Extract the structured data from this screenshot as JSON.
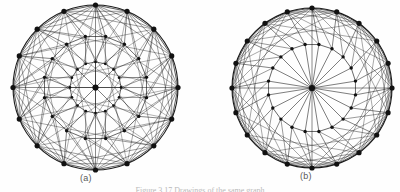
{
  "figure": {
    "background_color": "#fefefe",
    "line_color": "#1a1a1a",
    "vertex_color": "#111111",
    "caption_color": "#b9b9b9",
    "label_color": "#585858",
    "caption_text": "Figure 3.17   Drawings of the same graph",
    "panels": [
      {
        "id": "a",
        "label": "(a)",
        "center_x": 95.5,
        "center_y": 87.5,
        "radius": 82.5,
        "outer_vertices": 16,
        "rings": [
          {
            "name": "outer-ring",
            "radius_ratio": 1.0,
            "count": 16,
            "offset_deg": -90
          },
          {
            "name": "middle-ring",
            "radius_ratio": 0.63,
            "count": 16,
            "offset_deg": -78.75
          },
          {
            "name": "inner-ring",
            "radius_ratio": 0.31,
            "count": 16,
            "offset_deg": -90
          }
        ],
        "chord_steps": [
          2,
          3,
          5,
          7
        ],
        "has_hub": true,
        "hub_spokes": 8,
        "description": "dense circular layout with three concentric vertex rings and long chords"
      },
      {
        "id": "b",
        "label": "(b)",
        "center_x": 312.0,
        "center_y": 88.0,
        "radius": 80.0,
        "outer_vertices": 20,
        "rings": [
          {
            "name": "outer-ring",
            "radius_ratio": 1.0,
            "count": 20,
            "offset_deg": -90
          },
          {
            "name": "inner-ring",
            "radius_ratio": 0.55,
            "count": 20,
            "offset_deg": -81
          }
        ],
        "chord_steps": [
          2,
          3,
          5
        ],
        "has_hub": true,
        "hub_spokes": 20,
        "description": "hub-and-spoke circular layout, all inner ring vertices joined to centre"
      }
    ]
  }
}
